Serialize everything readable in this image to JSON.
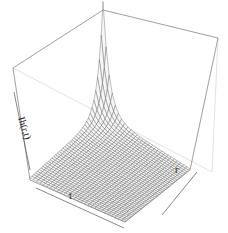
{
  "chart_data": {
    "type": "surface3d",
    "title": "",
    "xlabel": "t",
    "ylabel": "r",
    "zlabel": "Ih(r,t)",
    "grid": false,
    "box": true,
    "colors": {
      "mesh": "#444444",
      "box": "#888888",
      "background": "#ffffff"
    },
    "surface_samples": {
      "t_index": [
        0,
        0.1,
        0.2,
        0.3,
        0.5,
        0.7,
        1.0
      ],
      "r_index": [
        0,
        0.1,
        0.2,
        0.3,
        0.5,
        0.7,
        1.0
      ],
      "z_relative": [
        [
          1.0,
          0.3,
          0.12,
          0.06,
          0.03,
          0.02,
          0.01
        ],
        [
          0.35,
          0.15,
          0.08,
          0.05,
          0.03,
          0.02,
          0.01
        ],
        [
          0.15,
          0.08,
          0.05,
          0.04,
          0.02,
          0.02,
          0.01
        ],
        [
          0.08,
          0.05,
          0.04,
          0.03,
          0.02,
          0.01,
          0.01
        ],
        [
          0.04,
          0.03,
          0.03,
          0.02,
          0.02,
          0.01,
          0.01
        ],
        [
          0.03,
          0.02,
          0.02,
          0.02,
          0.01,
          0.01,
          0.01
        ],
        [
          0.02,
          0.02,
          0.01,
          0.01,
          0.01,
          0.01,
          0.01
        ]
      ]
    }
  }
}
